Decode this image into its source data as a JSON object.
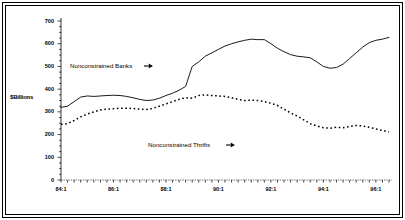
{
  "chart_data": {
    "type": "line",
    "title": "",
    "subtitle": "",
    "xlabel": "",
    "ylabel": "$Billions",
    "ylim": [
      0,
      700
    ],
    "ytick_values": [
      0,
      100,
      200,
      300,
      400,
      500,
      600,
      700
    ],
    "ytick_labels": [
      "0",
      "100",
      "200",
      "300",
      "400",
      "500",
      "600",
      "700"
    ],
    "xtick_labels": [
      "84:1",
      "86:1",
      "88:1",
      "90:1",
      "92:1",
      "94:1",
      "96:1"
    ],
    "xtick_x": [
      "84:1",
      "86:1",
      "88:1",
      "90:1",
      "92:1",
      "94:1",
      "96:1"
    ],
    "x_unit": "quarter",
    "x_start": "84:1",
    "x_end": "96:3",
    "grid": false,
    "legend": "inline-annotations",
    "annotations": [
      {
        "text": "Nonconstrained Banks",
        "arrow": "right",
        "target_series": "Nonconstrained Banks"
      },
      {
        "text": "Nonconstrained Thrifts",
        "arrow": "right",
        "target_series": "Nonconstrained Thrifts"
      }
    ],
    "x": [
      "84:1",
      "84:2",
      "84:3",
      "84:4",
      "85:1",
      "85:2",
      "85:3",
      "85:4",
      "86:1",
      "86:2",
      "86:3",
      "86:4",
      "87:1",
      "87:2",
      "87:3",
      "87:4",
      "88:1",
      "88:2",
      "88:3",
      "88:4",
      "89:1",
      "89:2",
      "89:3",
      "89:4",
      "90:1",
      "90:2",
      "90:3",
      "90:4",
      "91:1",
      "91:2",
      "91:3",
      "91:4",
      "92:1",
      "92:2",
      "92:3",
      "92:4",
      "93:1",
      "93:2",
      "93:3",
      "93:4",
      "94:1",
      "94:2",
      "94:3",
      "94:4",
      "95:1",
      "95:2",
      "95:3",
      "95:4",
      "96:1",
      "96:2",
      "96:3"
    ],
    "series": [
      {
        "name": "Nonconstrained Banks",
        "style": "solid",
        "color": "#000000",
        "values": [
          320,
          325,
          345,
          365,
          370,
          368,
          370,
          372,
          373,
          372,
          368,
          362,
          355,
          350,
          352,
          360,
          372,
          382,
          395,
          412,
          500,
          520,
          545,
          560,
          575,
          590,
          600,
          608,
          615,
          620,
          618,
          618,
          600,
          580,
          565,
          552,
          545,
          542,
          538,
          520,
          500,
          492,
          495,
          510,
          535,
          560,
          585,
          605,
          615,
          620,
          628
        ]
      },
      {
        "name": "Nonconstrained Thrifts",
        "style": "dotted",
        "color": "#000000",
        "values": [
          245,
          248,
          262,
          278,
          290,
          300,
          308,
          312,
          314,
          316,
          316,
          315,
          312,
          310,
          315,
          325,
          335,
          345,
          355,
          362,
          360,
          372,
          375,
          372,
          370,
          368,
          362,
          355,
          350,
          352,
          350,
          345,
          338,
          328,
          312,
          295,
          282,
          265,
          248,
          238,
          230,
          228,
          232,
          230,
          235,
          240,
          238,
          232,
          225,
          218,
          212
        ]
      }
    ]
  },
  "axis": {
    "y_label": "$Billions"
  }
}
